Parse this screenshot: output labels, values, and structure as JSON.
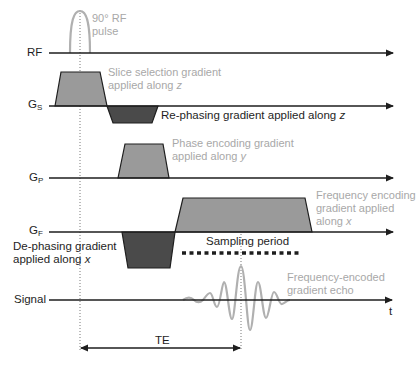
{
  "axes": {
    "rf": {
      "label": "RF"
    },
    "gs": {
      "label": "G",
      "sub": "S"
    },
    "gp": {
      "label": "G",
      "sub": "P"
    },
    "gf": {
      "label": "G",
      "sub": "F"
    },
    "signal": {
      "label": "Signal"
    },
    "time": {
      "label": "t"
    }
  },
  "annotations": {
    "rf_pulse": {
      "line1": "90° RF",
      "line2": "pulse"
    },
    "slice_selection": {
      "line1": "Slice selection gradient",
      "line2_prefix": "applied along ",
      "line2_axis": "z"
    },
    "rephasing": {
      "prefix": "Re-phasing gradient applied along ",
      "axis": "z"
    },
    "phase_encoding": {
      "line1": "Phase encoding gradient",
      "line2_prefix": "applied along ",
      "line2_axis": "y"
    },
    "frequency_encoding": {
      "line1": "Frequency encoding",
      "line2": "gradient applied",
      "line3_prefix": "along ",
      "line3_axis": "x"
    },
    "dephasing": {
      "line1": "De-phasing gradient",
      "line2_prefix": "applied along ",
      "line2_axis": "x"
    },
    "sampling": {
      "label": "Sampling period"
    },
    "echo": {
      "line1": "Frequency-encoded",
      "line2": "gradient echo"
    },
    "te": {
      "label": "TE"
    }
  },
  "colors": {
    "line": "#1e1e1e",
    "light_fill": "#9a9a9a",
    "dark_fill": "#4a4a4a",
    "signal_wave": "#b0b0b0",
    "gray_text": "#a8a8a8"
  }
}
